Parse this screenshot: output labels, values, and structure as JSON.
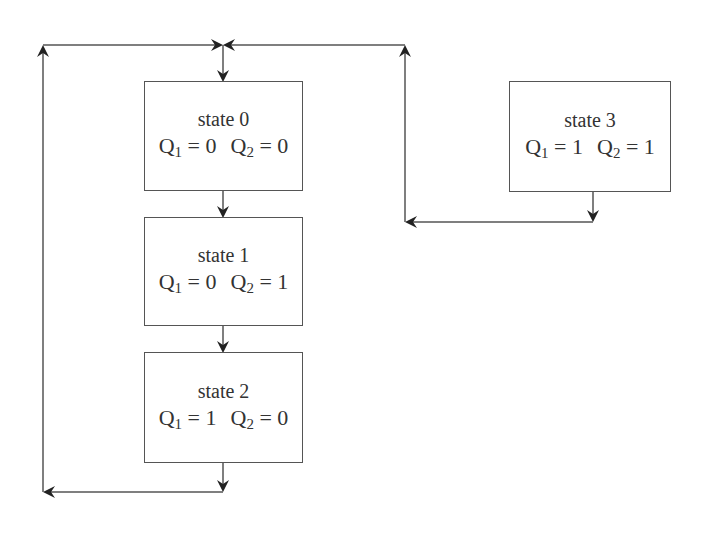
{
  "diagram": {
    "type": "state-flow",
    "states": [
      {
        "id": "state0",
        "title": "state 0",
        "q1": "0",
        "q2": "0"
      },
      {
        "id": "state1",
        "title": "state 1",
        "q1": "0",
        "q2": "1"
      },
      {
        "id": "state2",
        "title": "state 2",
        "q1": "1",
        "q2": "0"
      },
      {
        "id": "state3",
        "title": "state 3",
        "q1": "1",
        "q2": "1"
      }
    ],
    "labels": {
      "q_letter": "Q",
      "sub1": "1",
      "sub2": "2",
      "eq": " = "
    },
    "transitions": [
      {
        "from": "state0",
        "to": "state1"
      },
      {
        "from": "state1",
        "to": "state2"
      },
      {
        "from": "state2",
        "to": "state0"
      },
      {
        "from": "state3",
        "to": "state0"
      }
    ],
    "colors": {
      "line": "#555555",
      "arrow": "#222222",
      "text": "#333333"
    }
  }
}
